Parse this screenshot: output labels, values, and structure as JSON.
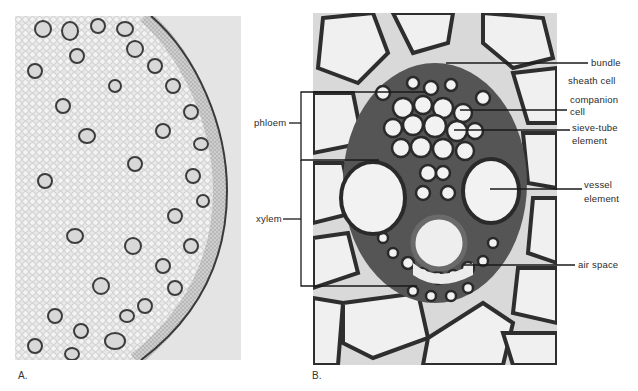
{
  "figure": {
    "caption_partial": "(cut-off caption text)",
    "panels": [
      {
        "id": "A",
        "label": "A.",
        "description": "Low-magnification cross section of a monocot stem showing scattered vascular bundles"
      },
      {
        "id": "B",
        "label": "B.",
        "description": "High-magnification view of a single vascular bundle"
      }
    ],
    "brackets": {
      "phloem": "phloem",
      "xylem": "xylem"
    },
    "annotations": {
      "bundle_line1": "bundle",
      "bundle_line2": "sheath cell",
      "companion_line1": "companion",
      "companion_line2": "cell",
      "sieve_line1": "sieve-tube",
      "sieve_line2": "element",
      "vessel_line1": "vessel",
      "vessel_line2": "element",
      "air_space": "air space"
    },
    "colors": {
      "background": "#ffffff",
      "tissue_light": "#e8e8e8",
      "cell_wall": "#2b2b2b",
      "leader_line": "#1a1a1a"
    }
  }
}
